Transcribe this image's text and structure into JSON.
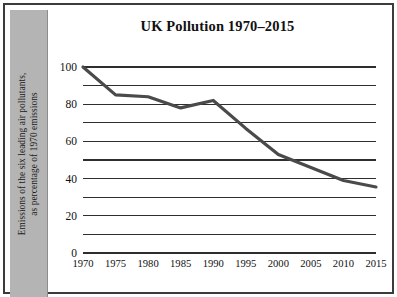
{
  "chart_data": {
    "type": "line",
    "title": "UK Pollution 1970–2015",
    "xlabel": "",
    "ylabel": "Emissions of the six leading air pollutants, as percentage of 1970 emissions",
    "ylabel_lines": [
      "Emissions of the six leading air pollutants,",
      "as percentage of 1970 emissions"
    ],
    "x": [
      1970,
      1975,
      1980,
      1985,
      1990,
      1995,
      2000,
      2005,
      2010,
      2015
    ],
    "values": [
      100,
      85,
      84,
      78,
      82,
      67,
      53,
      46,
      39,
      35.5
    ],
    "xtick_labels": [
      "1970",
      "1975",
      "1980",
      "1985",
      "1990",
      "1995",
      "2000",
      "2005",
      "2010",
      "2015"
    ],
    "ytick_labels": [
      "0",
      "20",
      "40",
      "60",
      "80",
      "100"
    ],
    "ytick_values": [
      0,
      20,
      40,
      60,
      80,
      100
    ],
    "gridline_values": [
      0,
      10,
      20,
      30,
      40,
      50,
      60,
      70,
      80,
      90,
      100
    ],
    "xlim": [
      1970,
      2015
    ],
    "ylim": [
      0,
      100
    ],
    "grid": true,
    "legend": false,
    "line_color": "#4a4a4a",
    "grid_color": "#2e2e2e",
    "band_color": "#b4b4b4",
    "frame_color": "#3b3b3b",
    "text_color": "#111111"
  }
}
